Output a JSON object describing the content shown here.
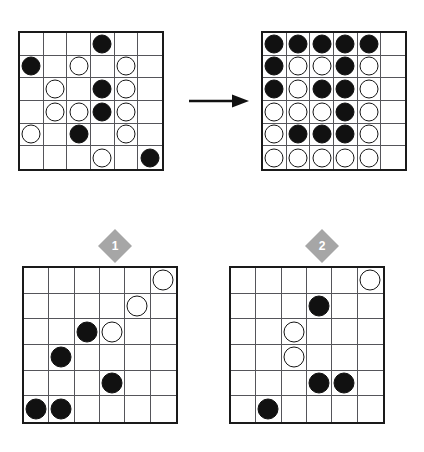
{
  "puzzle": {
    "type": "visual-analogy-matrix",
    "grid_size": {
      "rows": 6,
      "cols": 6
    },
    "legend": {
      "empty": "",
      "black_stone": "black",
      "white_stone": "white"
    },
    "arrow_label": "transforms-to",
    "colors": {
      "stone_black": "#111111",
      "stone_white": "#ffffff",
      "stone_outline": "#141414",
      "grid_line": "#55555a",
      "grid_border": "#1a1a1a",
      "badge_fill": "#a6a6a6",
      "badge_text": "#ffffff",
      "background": "#ffffff"
    }
  },
  "boards": {
    "before": {
      "name": "source-grid",
      "rows": [
        [
          "",
          "",
          "",
          "black",
          "",
          ""
        ],
        [
          "black",
          "",
          "white",
          "",
          "white",
          ""
        ],
        [
          "",
          "white",
          "",
          "black",
          "white",
          ""
        ],
        [
          "",
          "white",
          "white",
          "black",
          "white",
          ""
        ],
        [
          "white",
          "",
          "black",
          "",
          "white",
          ""
        ],
        [
          "",
          "",
          "",
          "white",
          "",
          "black"
        ]
      ]
    },
    "after": {
      "name": "target-grid",
      "rows": [
        [
          "black",
          "black",
          "black",
          "black",
          "black",
          ""
        ],
        [
          "black",
          "white",
          "white",
          "black",
          "white",
          ""
        ],
        [
          "black",
          "white",
          "black",
          "black",
          "white",
          ""
        ],
        [
          "white",
          "white",
          "white",
          "black",
          "white",
          ""
        ],
        [
          "white",
          "black",
          "black",
          "black",
          "white",
          ""
        ],
        [
          "white",
          "white",
          "white",
          "white",
          "white",
          ""
        ]
      ]
    }
  },
  "options": [
    {
      "number": "1",
      "name": "answer-option-1",
      "rows": [
        [
          "",
          "",
          "",
          "",
          "",
          "white"
        ],
        [
          "",
          "",
          "",
          "",
          "white",
          ""
        ],
        [
          "",
          "",
          "black",
          "white",
          "",
          ""
        ],
        [
          "",
          "black",
          "",
          "",
          "",
          ""
        ],
        [
          "",
          "",
          "",
          "black",
          "",
          ""
        ],
        [
          "black",
          "black",
          "",
          "",
          "",
          ""
        ]
      ]
    },
    {
      "number": "2",
      "name": "answer-option-2",
      "rows": [
        [
          "",
          "",
          "",
          "",
          "",
          "white"
        ],
        [
          "",
          "",
          "",
          "black",
          "",
          ""
        ],
        [
          "",
          "",
          "white",
          "",
          "",
          ""
        ],
        [
          "",
          "",
          "white",
          "",
          "",
          ""
        ],
        [
          "",
          "",
          "",
          "black",
          "black",
          ""
        ],
        [
          "",
          "black",
          "",
          "",
          "",
          ""
        ]
      ]
    }
  ]
}
